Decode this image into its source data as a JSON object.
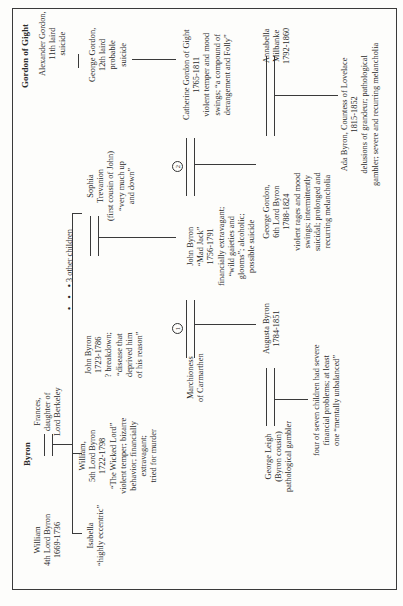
{
  "families": {
    "byron": "Byron",
    "gordon": "Gordon of Gight"
  },
  "people": {
    "william4": [
      "William",
      "4th Lord Byron",
      "1669-1736"
    ],
    "frances": [
      "Frances,",
      "daughter of",
      "Lord Berkeley"
    ],
    "isabella": [
      "Isabella",
      "“highly eccentric”"
    ],
    "william5": [
      "William,",
      "5th Lord Byron",
      "1722-1798",
      "“The Wicked Lord”",
      "violent temper; bizarre",
      "behavior; financially",
      "extravagant;",
      "tried for murder"
    ],
    "johnByron1723": [
      "John Byron",
      "1723-1786",
      "? breakdown;",
      "“disease that",
      "deprived him",
      "of his reason”"
    ],
    "otherChildren": "3 other children",
    "sophia": [
      "Sophia",
      "Trevanion",
      "(first cousin of John)",
      "“very much up",
      "and down”"
    ],
    "marchioness": [
      "Marchioness",
      "of Carmarthen"
    ],
    "madJack": [
      "John Byron",
      "“Mad Jack”",
      "1756-1791",
      "financially extravagant;",
      "“wild gaieties and",
      "glooms”; alcoholic;",
      "possible suicide"
    ],
    "alexander": [
      "Alexander Gordon,",
      "11th laird",
      "suicide"
    ],
    "georgeGordon12": [
      "George Gordon,",
      "12th laird",
      "probable",
      "suicide"
    ],
    "catherine": [
      "Catherine Gordon of Gight",
      "1765-1811",
      "violent temper and mood",
      "swings; “a compound of",
      "derangement and Folly”"
    ],
    "augusta": [
      "Augusta Byron",
      "1784-1851"
    ],
    "georgeLeigh": [
      "George Leigh",
      "(Byron cousin)",
      "pathological gambler"
    ],
    "leighChildren": [
      "four of seven children had severe",
      "financial problems; at least",
      "one “mentally unbalanced”"
    ],
    "lordByron6": [
      "George Gordon,",
      "6th Lord Byron",
      "1788-1824",
      "violent rages and mood",
      "swings; intermittently",
      "suicidal; prolonged and",
      "recurring melancholia"
    ],
    "annabella": [
      "Annabella",
      "Milbanke",
      "1792-1860"
    ],
    "ada": [
      "Ada Byron, Countess of Lovelace",
      "1815-1852",
      "delusions of grandeur; pathological",
      "gambler; severe and recurring melancholia"
    ]
  },
  "marriage_markers": [
    "1",
    "2"
  ],
  "colors": {
    "line": "#3a3a3a",
    "text": "#2a2a2a",
    "background": "#fdfdfb"
  }
}
